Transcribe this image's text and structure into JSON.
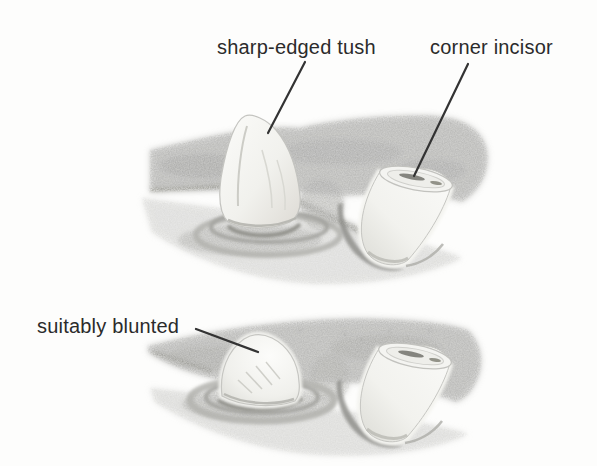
{
  "figure": {
    "labels": {
      "top_left": "sharp-edged tush",
      "top_right": "corner incisor",
      "bottom": "suitably blunted"
    },
    "colors": {
      "background": "#fdfdfc",
      "ink": "#2b2b2b",
      "leader_line": "#333333",
      "gum_shade": "#b0b0ae",
      "gum_light": "#d9d9d7",
      "tooth": "#f8f8f6",
      "shadow": "#9a9a98"
    }
  }
}
